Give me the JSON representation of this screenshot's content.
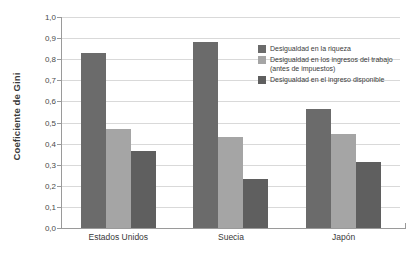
{
  "chart_data": {
    "type": "bar",
    "title": "",
    "xlabel": "",
    "ylabel": "Coeficiente de Gini",
    "ylim": [
      0.0,
      1.0
    ],
    "grid": true,
    "legend_position": "top-right",
    "categories": [
      "Estados Unidos",
      "Suecia",
      "Japón"
    ],
    "ytick_labels": [
      "1,0",
      "0,9",
      "0,8",
      "0,7",
      "0,6",
      "0,5",
      "0,4",
      "0,3",
      "0,2",
      "0,1",
      "0,0"
    ],
    "ytick_values": [
      1.0,
      0.9,
      0.8,
      0.7,
      0.6,
      0.5,
      0.4,
      0.3,
      0.2,
      0.1,
      0.0
    ],
    "series": [
      {
        "name": "Desigualdad en la riqueza",
        "color": "#6b6b6b",
        "values": [
          0.83,
          0.88,
          0.565
        ]
      },
      {
        "name": "Desigualdad en los ingresos del trabajo (antes de impuestos)",
        "color": "#a5a5a5",
        "values": [
          0.47,
          0.43,
          0.445
        ]
      },
      {
        "name": "Desigualdad en el ingreso disponible",
        "color": "#5f5f5f",
        "values": [
          0.365,
          0.23,
          0.315
        ]
      }
    ]
  },
  "axis": {
    "y_title": "Coeficiente de Gini"
  },
  "legend": {
    "items": [
      {
        "label": "Desigualdad en la riqueza",
        "color": "#6b6b6b"
      },
      {
        "label": "Desigualdad en los ingresos del trabajo (antes de impuestos)",
        "color": "#a5a5a5"
      },
      {
        "label": "Desigualdad en el ingreso disponible",
        "color": "#5f5f5f"
      }
    ]
  },
  "colors": {
    "background": "#ffffff",
    "gridline": "#d9d9d9",
    "axis": "#9a9a9a",
    "text": "#3a3a3a"
  }
}
